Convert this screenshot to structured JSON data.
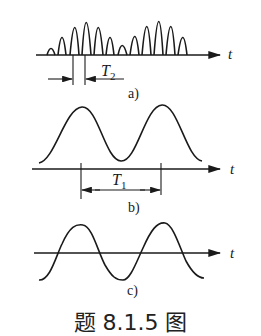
{
  "diagram": {
    "panels": [
      {
        "id": "a",
        "label": "a)",
        "axis_label": "t",
        "description": "Amplitude-modulated pulse train (burst of narrow pulses)",
        "period_label": "T",
        "period_subscript": "2",
        "pulse_heights_group1": [
          0.15,
          0.5,
          0.85,
          1.0,
          0.85,
          0.5
        ],
        "pulse_heights_group2": [
          0.25,
          0.55,
          0.88,
          1.0,
          0.88,
          0.55
        ]
      },
      {
        "id": "b",
        "label": "b)",
        "axis_label": "t",
        "description": "Smooth envelope waveform above axis",
        "period_label": "T",
        "period_subscript": "1"
      },
      {
        "id": "c",
        "label": "c)",
        "axis_label": "t",
        "description": "Sinusoidal waveform crossing the axis"
      }
    ],
    "caption": "题 8.1.5 图"
  }
}
